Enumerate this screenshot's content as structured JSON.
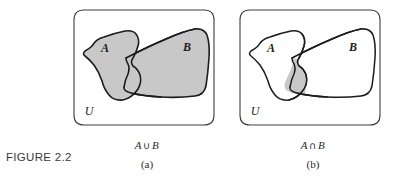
{
  "figure": {
    "label": "FIGURE 2.2"
  },
  "colors": {
    "background": "#ffffff",
    "stroke": "#1c1c1c",
    "box_stroke": "#3d3d3d",
    "shaded_fill": "#c8c8c8",
    "unshaded_fill": "#ffffff",
    "text": "#2b2b2b"
  },
  "panels": [
    {
      "id": "a",
      "sublabel": "(a)",
      "expression": {
        "left": "A",
        "operator": "∪",
        "right": "B"
      },
      "universe_label": "U",
      "set_a_label": "A",
      "set_b_label": "B",
      "shading": "union",
      "set_a_shaded": true,
      "set_b_shaded": true
    },
    {
      "id": "b",
      "sublabel": "(b)",
      "expression": {
        "left": "A",
        "operator": "∩",
        "right": "B"
      },
      "universe_label": "U",
      "set_a_label": "A",
      "set_b_label": "B",
      "shading": "intersection",
      "set_a_shaded": false,
      "set_b_shaded": false
    }
  ],
  "geometry": {
    "box_path": "M 22 10 L 142 10 Q 152 10 152 20 L 152 115 Q 152 125 142 125 L 22 125 Q 12 125 12 115 L 12 20 Q 12 10 22 10 Z",
    "set_a_path": "M 30 46 Q 33 39 41 38 Q 52 33 62 31 Q 70 30 74 33 Q 78 37 77 44 Q 76 52 73 57 Q 70 62 72 66 Q 76 68 78 74 Q 80 81 76 88 Q 71 97 62 100 Q 53 102 47 96 Q 42 90 40 82 Q 37 73 32 66 Q 27 60 23 57 Q 20 55 22 52 Q 26 50 30 46 Z",
    "set_b_path": "M 64 58 Q 85 47 104 39 Q 122 31 133 29 Q 142 28 145 34 Q 148 42 147 56 Q 146 72 144 85 Q 142 94 134 96 Q 118 98 100 97 Q 82 96 70 93 Q 62 91 62 87 Q 63 80 66 74 Q 68 68 66 64 Q 64 61 64 58 Z",
    "intersection_path": "M 64 58 Q 66 61 66 64 Q 68 68 66 74 Q 63 80 62 87 Q 62 91 70 93 L 70 93 Q 60 93 57 91 Q 55 88 57 82 Q 60 74 61 68 Q 62 63 60 59 Z"
  }
}
